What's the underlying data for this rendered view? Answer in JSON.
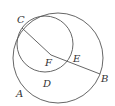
{
  "diagram": {
    "stroke_color": "#555555",
    "outer_circle": {
      "cx": 58,
      "cy": 58,
      "r": 45
    },
    "inner_circle": {
      "cx": 45,
      "cy": 44,
      "r": 28
    },
    "segments": [
      {
        "from": "C",
        "to": "F"
      },
      {
        "from": "F",
        "to": "B"
      }
    ],
    "points": {
      "C": {
        "label": "C",
        "x": 22,
        "y": 28
      },
      "F": {
        "label": "F",
        "x": 51,
        "y": 55
      },
      "E": {
        "label": "E",
        "x": 70,
        "y": 61
      },
      "B": {
        "label": "B",
        "x": 100,
        "y": 74
      },
      "D": {
        "label": "D",
        "x": 46,
        "y": 78
      },
      "A": {
        "label": "A",
        "x": 18,
        "y": 92
      }
    }
  }
}
